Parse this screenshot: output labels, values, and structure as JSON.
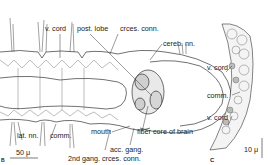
{
  "figure": {
    "panel_b": {
      "letter": "B",
      "labels": {
        "v_cord": "v. cord",
        "post_lobe": "post. lobe",
        "crces_conn": "crces. conn.",
        "cereb_nn": "cereb. nn.",
        "lat_nn": "lat. nn.",
        "comm": "comm.",
        "mouth": "mouth",
        "fiber_core": "fiber core of brain",
        "acc_gang": "acc. gang.",
        "second_gang": "2nd gang. crces. conn."
      },
      "scale_bar": "50 μ"
    },
    "panel_c": {
      "letter": "C",
      "labels": {
        "v_cord_top": "v. cord",
        "comm": "comm.",
        "v_cord_bottom": "v. cord"
      },
      "scale_bar": "10 μ"
    }
  }
}
